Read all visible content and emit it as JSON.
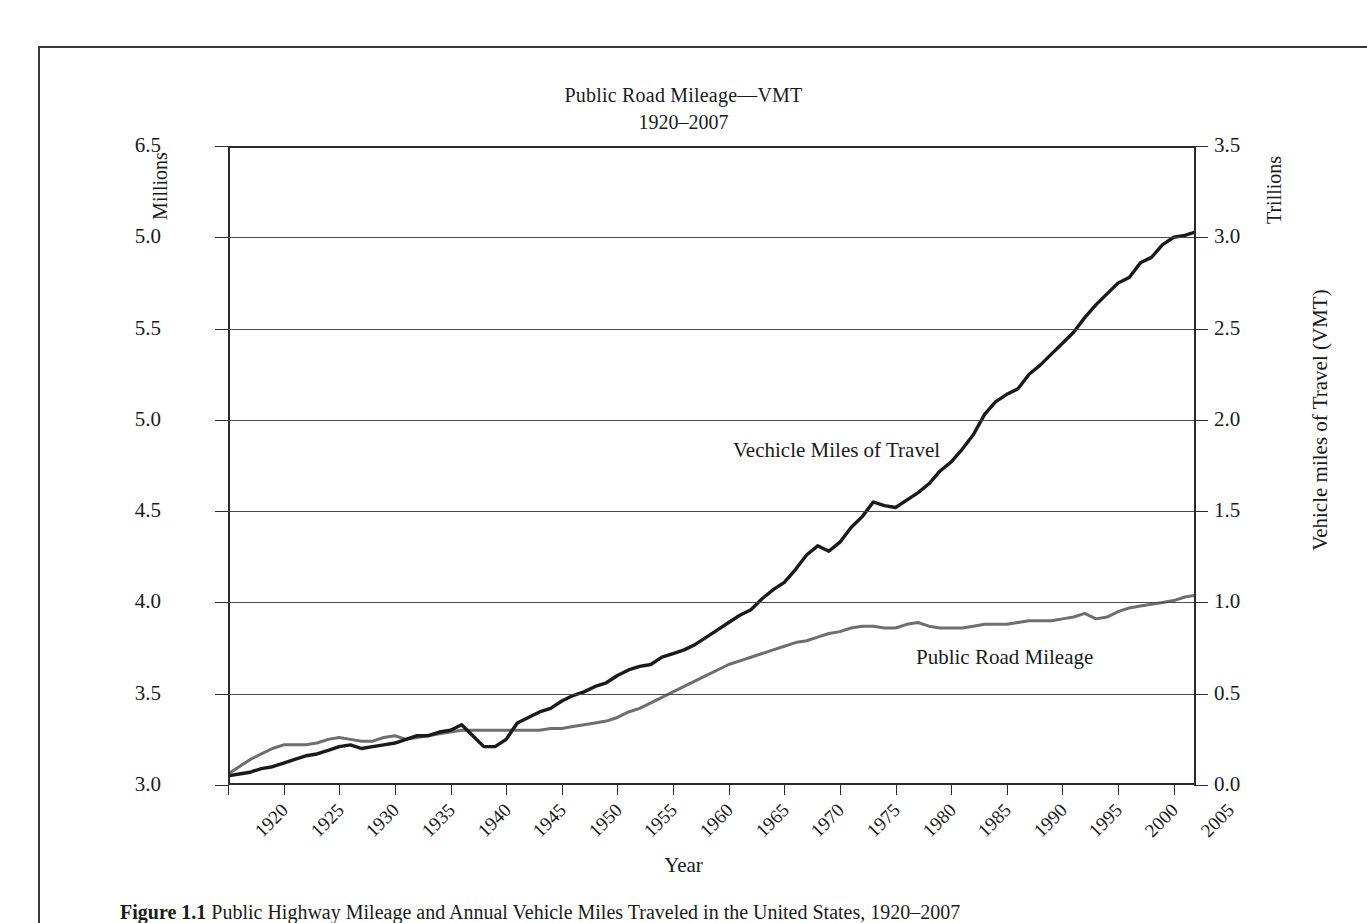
{
  "figure": {
    "caption_label": "Figure 1.1",
    "caption_text": "Public Highway Mileage and Annual Vehicle Miles Traveled in the United States, 1920–2007"
  },
  "chart_data": {
    "type": "line",
    "title": "Public Road Mileage—VMT",
    "subtitle": "1920–2007",
    "xlabel": "Year",
    "ylabel_left": "Public Road Mileage",
    "ylabel_right": "Vehicle miles of Travel (VMT)",
    "unit_left": "Millions",
    "unit_right": "Trillions",
    "grid": true,
    "legend_position": "inline-annotation",
    "xlim": [
      1920,
      2007
    ],
    "xticks": [
      1920,
      1925,
      1930,
      1935,
      1940,
      1945,
      1950,
      1955,
      1960,
      1965,
      1970,
      1975,
      1980,
      1985,
      1990,
      1995,
      2000,
      2005
    ],
    "ylim_left": [
      3.0,
      6.5
    ],
    "yticks_left": [
      "3.0",
      "3.5",
      "4.0",
      "4.5",
      "5.0",
      "5.5",
      "5.0",
      "6.5"
    ],
    "ylim_right": [
      0.0,
      3.5
    ],
    "yticks_right": [
      "0.0",
      "0.5",
      "1.0",
      "1.5",
      "2.0",
      "2.5",
      "3.0",
      "3.5"
    ],
    "colors": {
      "vmt_line": "#1a1a1a",
      "mileage_line": "#6e6e6e",
      "grid": "#4a4a4a",
      "axis": "#2b2b2b"
    },
    "x": [
      1920,
      1921,
      1922,
      1923,
      1924,
      1925,
      1926,
      1927,
      1928,
      1929,
      1930,
      1931,
      1932,
      1933,
      1934,
      1935,
      1936,
      1937,
      1938,
      1939,
      1940,
      1941,
      1942,
      1943,
      1944,
      1945,
      1946,
      1947,
      1948,
      1949,
      1950,
      1951,
      1952,
      1953,
      1954,
      1955,
      1956,
      1957,
      1958,
      1959,
      1960,
      1961,
      1962,
      1963,
      1964,
      1965,
      1966,
      1967,
      1968,
      1969,
      1970,
      1971,
      1972,
      1973,
      1974,
      1975,
      1976,
      1977,
      1978,
      1979,
      1980,
      1981,
      1982,
      1983,
      1984,
      1985,
      1986,
      1987,
      1988,
      1989,
      1990,
      1991,
      1992,
      1993,
      1994,
      1995,
      1996,
      1997,
      1998,
      1999,
      2000,
      2001,
      2002,
      2003,
      2004,
      2005,
      2006,
      2007
    ],
    "series": [
      {
        "name": "Vechicle Miles of Travel",
        "axis": "right",
        "units": "trillions of vehicle miles",
        "values": [
          0.05,
          0.06,
          0.07,
          0.09,
          0.1,
          0.12,
          0.14,
          0.16,
          0.17,
          0.19,
          0.21,
          0.22,
          0.2,
          0.21,
          0.22,
          0.23,
          0.25,
          0.27,
          0.27,
          0.29,
          0.3,
          0.33,
          0.27,
          0.21,
          0.21,
          0.25,
          0.34,
          0.37,
          0.4,
          0.42,
          0.46,
          0.49,
          0.51,
          0.54,
          0.56,
          0.6,
          0.63,
          0.65,
          0.66,
          0.7,
          0.72,
          0.74,
          0.77,
          0.81,
          0.85,
          0.89,
          0.93,
          0.96,
          1.02,
          1.07,
          1.11,
          1.18,
          1.26,
          1.31,
          1.28,
          1.33,
          1.41,
          1.47,
          1.55,
          1.53,
          1.52,
          1.56,
          1.6,
          1.65,
          1.72,
          1.77,
          1.84,
          1.92,
          2.03,
          2.1,
          2.14,
          2.17,
          2.25,
          2.3,
          2.36,
          2.42,
          2.48,
          2.56,
          2.63,
          2.69,
          2.75,
          2.78,
          2.86,
          2.89,
          2.96,
          3.0,
          3.01,
          3.03
        ]
      },
      {
        "name": "Public Road Mileage",
        "axis": "left",
        "units": "millions of miles",
        "values": [
          3.06,
          3.1,
          3.14,
          3.17,
          3.2,
          3.22,
          3.22,
          3.22,
          3.23,
          3.25,
          3.26,
          3.25,
          3.24,
          3.24,
          3.26,
          3.27,
          3.25,
          3.26,
          3.27,
          3.28,
          3.29,
          3.3,
          3.3,
          3.3,
          3.3,
          3.3,
          3.3,
          3.3,
          3.3,
          3.31,
          3.31,
          3.32,
          3.33,
          3.34,
          3.35,
          3.37,
          3.4,
          3.42,
          3.45,
          3.48,
          3.51,
          3.54,
          3.57,
          3.6,
          3.63,
          3.66,
          3.68,
          3.7,
          3.72,
          3.74,
          3.76,
          3.78,
          3.79,
          3.81,
          3.83,
          3.84,
          3.86,
          3.87,
          3.87,
          3.86,
          3.86,
          3.88,
          3.89,
          3.87,
          3.86,
          3.86,
          3.86,
          3.87,
          3.88,
          3.88,
          3.88,
          3.89,
          3.9,
          3.9,
          3.9,
          3.91,
          3.92,
          3.94,
          3.91,
          3.92,
          3.95,
          3.97,
          3.98,
          3.99,
          4.0,
          4.01,
          4.03,
          4.04
        ]
      }
    ],
    "annotations": [
      {
        "text": "Vechicle Miles of Travel",
        "near_year": 1975
      },
      {
        "text": "Public Road Mileage",
        "near_year": 1995
      }
    ]
  }
}
